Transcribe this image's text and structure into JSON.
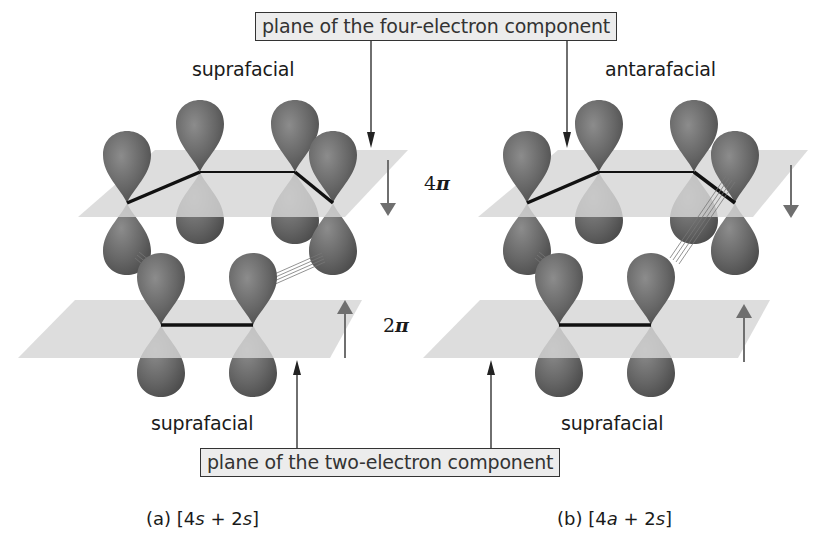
{
  "labels": {
    "top_box": "plane of the four-electron component",
    "bottom_box": "plane of the two-electron component",
    "left_top": "suprafacial",
    "right_top": "antarafacial",
    "left_bottom": "suprafacial",
    "right_bottom": "suprafacial",
    "four_pi": "4",
    "two_pi": "2",
    "pi_symbol": "π",
    "caption_a_prefix": "(a) [4",
    "caption_a_mid1": "s",
    "caption_a_mid2": " + 2",
    "caption_a_mid3": "s",
    "caption_a_suffix": "]",
    "caption_b_prefix": "(b) [4",
    "caption_b_mid1": "a",
    "caption_b_mid2": " + 2",
    "caption_b_mid3": "s",
    "caption_b_suffix": "]"
  },
  "colors": {
    "lobe_dark": "#5e5e5e",
    "lobe_light": "#8a8a8a",
    "plane": "#d4d4d4",
    "arrow_gray": "#6f6f6f",
    "bond": "#111111"
  },
  "panels": [
    {
      "id": "a",
      "offset_x": 0,
      "upper_mode": "suprafacial",
      "lower_mode": "suprafacial"
    },
    {
      "id": "b",
      "offset_x": 408,
      "upper_mode": "antarafacial",
      "lower_mode": "suprafacial"
    }
  ]
}
